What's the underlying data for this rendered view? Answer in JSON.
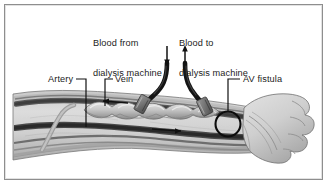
{
  "figure": {
    "border_color": "#8e8e8e",
    "background_color": "#ffffff",
    "ink_color": "#1c1c1c"
  },
  "labels": {
    "blood_from": {
      "line1": "Blood from",
      "line2": "dialysis machine"
    },
    "blood_to": {
      "line1": "Blood to",
      "line2": "dialysis machine"
    },
    "artery": "Artery",
    "vein": "Vein",
    "av_fistula": "AV fistula"
  },
  "anatomy": {
    "forearm": "forearm",
    "hand": "clenched fist",
    "artery_vessel": "artery",
    "vein_vessel": "fistula vein",
    "fistula_marker": "AV fistula anastomosis circle"
  },
  "flow": {
    "vein_arrow_direction": "left",
    "artery_arrow_direction": "right",
    "inflow_tube_arrow_direction": "down",
    "outflow_tube_arrow_direction": "up"
  },
  "equipment": {
    "inflow_tube": "dialysis inflow tubing",
    "outflow_tube": "dialysis outflow tubing",
    "inflow_needle": "arterial needle",
    "outflow_needle": "venous needle"
  },
  "colors": {
    "skin_light": "#d7d7d7",
    "skin_mid": "#b5b5b5",
    "skin_shadow": "#8f8f8f",
    "vessel_dark": "#3a3a3a",
    "vessel_mid": "#6b6b6b",
    "tube_dark": "#181818",
    "needle_grey": "#777777"
  }
}
